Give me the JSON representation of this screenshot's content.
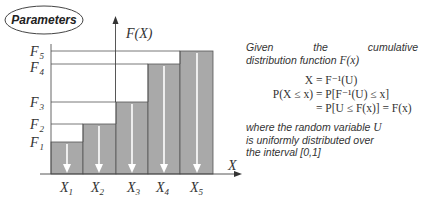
{
  "parameters_label": "Parameters",
  "y_axis_label": "F(X)",
  "x_axis_label": "X",
  "levels": [
    {
      "label": "F",
      "sub": "1",
      "y": 142
    },
    {
      "label": "F",
      "sub": "2",
      "y": 124
    },
    {
      "label": "F",
      "sub": "3",
      "y": 102
    },
    {
      "label": "F",
      "sub": "4",
      "y": 64
    },
    {
      "label": "F",
      "sub": "5",
      "y": 51
    }
  ],
  "columns": [
    {
      "label": "X",
      "sub": "1"
    },
    {
      "label": "X",
      "sub": "2"
    },
    {
      "label": "X",
      "sub": "3"
    },
    {
      "label": "X",
      "sub": "4"
    },
    {
      "label": "X",
      "sub": "5"
    }
  ],
  "colors": {
    "bar_fill": "#a9a9a9",
    "line": "#555555",
    "arrow": "#ffffff",
    "text": "#333333"
  },
  "explanation": {
    "intro_line1": "Given the cumulative",
    "intro_line2_text": "distribution function ",
    "intro_line2_math": "F(x)",
    "eq1_lhs": "X",
    "eq1_rhs": "= F⁻¹(U)",
    "eq2_lhs": "P(X ≤ x)",
    "eq2_rhs": "= P[F⁻¹(U) ≤ x]",
    "eq3_rhs": "= P[U ≤ F(x)] = F(x)",
    "outro_line1_text": "where the random variable ",
    "outro_line1_math": "U",
    "outro_line2": "is uniformly distributed over",
    "outro_line3": "the interval [0,1]"
  }
}
